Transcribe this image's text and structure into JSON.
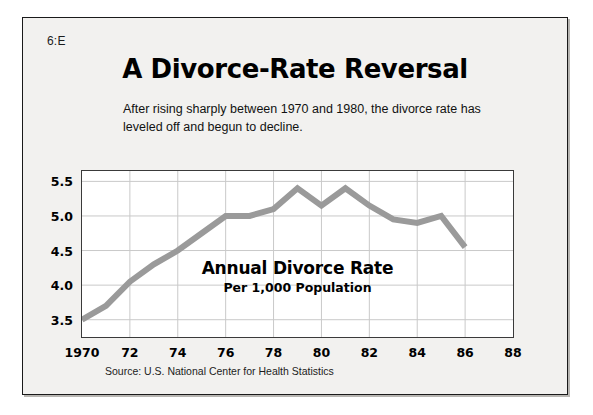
{
  "page_code": "6:E",
  "title": "A Divorce-Rate Reversal",
  "subtitle": "After rising sharply between 1970 and 1980, the divorce rate has leveled off and begun to decline.",
  "source": "Source: U.S. National Center for Health Statistics",
  "annotation": {
    "main": "Annual Divorce Rate",
    "sub": "Per 1,000 Population"
  },
  "colors": {
    "line": "#9a9a9a",
    "grid": "#c9c9c9",
    "frame": "#3a3a3a",
    "card_bg": "#f2f1ef",
    "text": "#000000"
  },
  "chart_data": {
    "type": "line",
    "title": "A Divorce-Rate Reversal",
    "subtitle": "After rising sharply between 1970 and 1980, the divorce rate has leveled off and begun to decline.",
    "xlabel": "",
    "ylabel": "Annual Divorce Rate Per 1,000 Population",
    "xlim": [
      1970,
      1988
    ],
    "ylim": [
      3.25,
      5.65
    ],
    "yticks": [
      3.5,
      4.0,
      4.5,
      5.0,
      5.5
    ],
    "ytick_labels": [
      "3.5",
      "4.0",
      "4.5",
      "5.0",
      "5.5"
    ],
    "xticks": [
      1970,
      1972,
      1974,
      1976,
      1978,
      1980,
      1982,
      1984,
      1986,
      1988
    ],
    "xtick_labels": [
      "1970",
      "72",
      "74",
      "76",
      "78",
      "80",
      "82",
      "84",
      "86",
      "88"
    ],
    "grid": true,
    "legend": null,
    "series": [
      {
        "name": "Annual Divorce Rate Per 1,000 Population",
        "x": [
          1970,
          1971,
          1972,
          1973,
          1974,
          1975,
          1976,
          1977,
          1978,
          1979,
          1980,
          1981,
          1982,
          1983,
          1984,
          1985,
          1986
        ],
        "values": [
          3.5,
          3.7,
          4.05,
          4.3,
          4.5,
          4.75,
          5.0,
          5.0,
          5.1,
          5.4,
          5.15,
          5.4,
          5.15,
          4.95,
          4.9,
          5.0,
          4.55
        ]
      }
    ],
    "annotations": [
      {
        "text": "Annual Divorce Rate",
        "x": 1981,
        "y": 4.35
      },
      {
        "text": "Per 1,000 Population",
        "x": 1981,
        "y": 4.18
      }
    ]
  }
}
